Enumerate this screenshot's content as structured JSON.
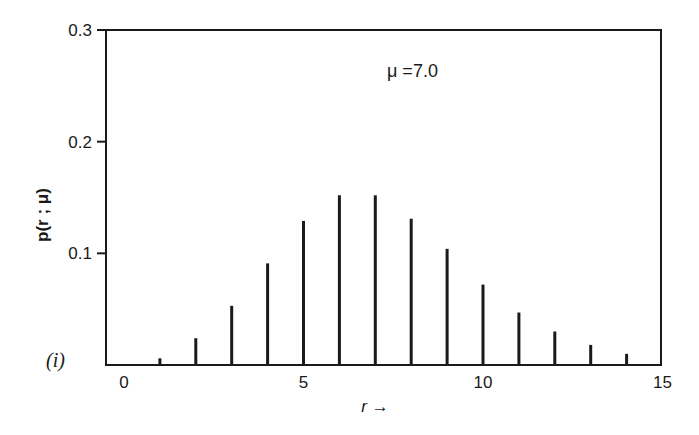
{
  "chart_data": {
    "type": "bar",
    "title": "",
    "panel_label": "(i)",
    "annotation": "μ =7.0",
    "xlabel": "r →",
    "ylabel": "p(r ; μ)",
    "xlim": [
      0,
      15
    ],
    "ylim": [
      0,
      0.3
    ],
    "x_ticks": [
      0,
      5,
      10,
      15
    ],
    "x_tick_labels": [
      "0",
      "5",
      "10",
      "15"
    ],
    "y_ticks": [
      0.1,
      0.2,
      0.3
    ],
    "y_tick_labels": [
      "0.1",
      "0.2",
      "0.3"
    ],
    "grid": false,
    "legend": null,
    "categories": [
      1,
      2,
      3,
      4,
      5,
      6,
      7,
      8,
      9,
      10,
      11,
      12,
      13,
      14
    ],
    "values": [
      0.006,
      0.024,
      0.053,
      0.091,
      0.129,
      0.152,
      0.152,
      0.131,
      0.104,
      0.072,
      0.047,
      0.03,
      0.018,
      0.01
    ]
  }
}
